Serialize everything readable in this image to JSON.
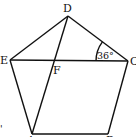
{
  "diagram": {
    "type": "geometry",
    "shape": "regular pentagon ABCDE with diagonals",
    "vertices": {
      "D": {
        "label": "D",
        "x": 68,
        "y": 16
      },
      "E": {
        "label": "E",
        "x": 10,
        "y": 60
      },
      "C": {
        "label": "C",
        "x": 128,
        "y": 61
      },
      "A": {
        "label": "A",
        "x": 32,
        "y": 134
      },
      "B": {
        "label": "B",
        "x": 108,
        "y": 134
      },
      "F": {
        "label": "F",
        "x": 55,
        "y": 61
      }
    },
    "segments": [
      "DE",
      "DC",
      "EA",
      "CB",
      "AB",
      "EC",
      "DA"
    ],
    "intersection": "F = EC ∩ DA",
    "angle_mark": {
      "at": "C",
      "between": [
        "CD",
        "CE"
      ],
      "label": "36°"
    },
    "stray_mark": "'"
  }
}
